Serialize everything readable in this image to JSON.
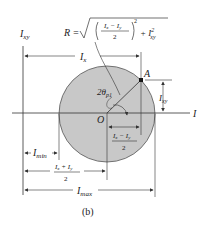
{
  "figure": {
    "caption": "(b)",
    "vertical_axis_label": "I_xy",
    "horizontal_axis_label": "I",
    "origin_label": "O",
    "point_label": "A",
    "radius_formula": {
      "lhs": "R =",
      "numerator": "I_x − I_y",
      "denominator": "2",
      "exponent": "2",
      "plus_term": "+ I²_xy"
    },
    "angle_label": "2θ_p1",
    "dimensions": {
      "ix": "I_x",
      "ixy": "I_xy",
      "half_diff_num": "I_x − I_y",
      "half_diff_den": "2",
      "imin": "I_min",
      "avg_num": "I_x + I_y",
      "avg_den": "2",
      "imax": "I_max"
    },
    "colors": {
      "circle_fill": "#c8c8c8",
      "line": "#333333",
      "background": "#ffffff"
    }
  }
}
